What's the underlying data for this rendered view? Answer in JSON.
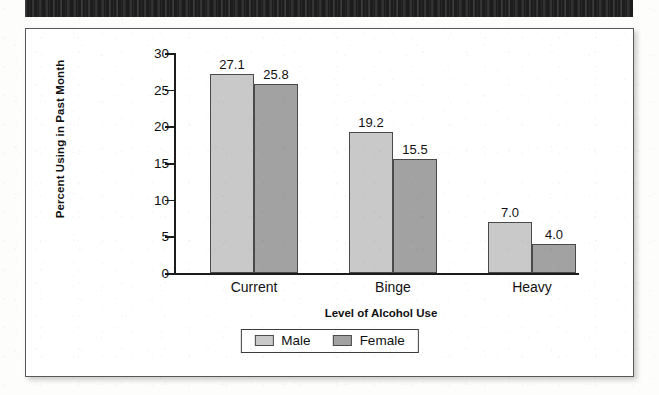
{
  "header": {
    "strip_label": ""
  },
  "chart_data": {
    "type": "bar",
    "title": "",
    "xlabel": "Level of Alcohol Use",
    "ylabel": "Percent Using in Past Month",
    "categories": [
      "Current",
      "Binge",
      "Heavy"
    ],
    "series": [
      {
        "name": "Male",
        "color": "#c9c9c9",
        "values": [
          27.1,
          19.2,
          7.0
        ]
      },
      {
        "name": "Female",
        "color": "#a2a2a2",
        "values": [
          25.8,
          15.5,
          4.0
        ]
      }
    ],
    "value_labels": [
      [
        "27.1",
        "25.8"
      ],
      [
        "19.2",
        "15.5"
      ],
      [
        "7.0",
        "4.0"
      ]
    ],
    "ylim": [
      0,
      30
    ],
    "yticks": [
      0,
      5,
      10,
      15,
      20,
      25,
      30
    ],
    "ytick_labels": [
      "0",
      "5",
      "10",
      "15",
      "20",
      "25",
      "30"
    ],
    "grid": false,
    "legend_position": "bottom"
  }
}
